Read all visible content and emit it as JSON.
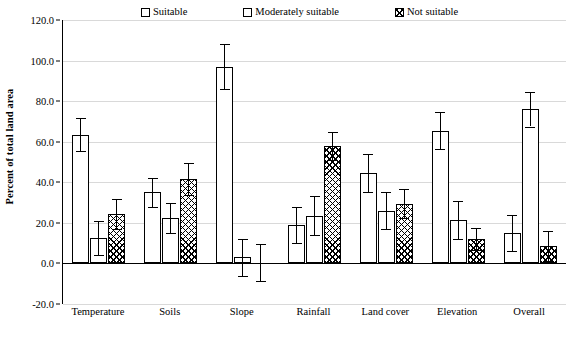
{
  "chart_data": {
    "type": "bar",
    "title": "",
    "subtitle": "",
    "xlabel": "",
    "ylabel": "Percent of total land area",
    "ylim": [
      -20.0,
      120.0
    ],
    "ytick_labels": [
      "120.0",
      "100.0",
      "80.0",
      "60.0",
      "40.0",
      "20.0",
      "0.0",
      "-20.0"
    ],
    "ytick_values": [
      120.0,
      100.0,
      80.0,
      60.0,
      40.0,
      20.0,
      0.0,
      -20.0
    ],
    "grid": true,
    "legend_position": "top-center",
    "categories": [
      "Temperature",
      "Soils",
      "Slope",
      "Rainfall",
      "Land cover",
      "Elevation",
      "Overall"
    ],
    "series": [
      {
        "name": "Suitable",
        "pattern": "dots",
        "values": [
          63.5,
          35.0,
          97.0,
          19.0,
          44.5,
          65.5,
          15.0
        ],
        "errors": [
          8.0,
          7.0,
          11.0,
          9.0,
          9.5,
          9.0,
          9.0
        ]
      },
      {
        "name": "Moderately suitable",
        "pattern": "plain",
        "values": [
          12.5,
          22.5,
          3.0,
          23.5,
          26.0,
          21.5,
          76.0
        ],
        "errors": [
          8.5,
          7.5,
          9.0,
          9.5,
          9.0,
          9.5,
          8.5
        ]
      },
      {
        "name": "Not suitable",
        "pattern": "crosshatch",
        "values": [
          24.5,
          41.5,
          0.0,
          58.0,
          29.5,
          12.0,
          8.5
        ],
        "errors": [
          7.5,
          8.0,
          9.5,
          7.0,
          7.0,
          5.5,
          7.5
        ]
      }
    ]
  },
  "legend": {
    "items": [
      {
        "label": "Suitable",
        "pattern": "dots"
      },
      {
        "label": "Moderately suitable",
        "pattern": "plain"
      },
      {
        "label": "Not suitable",
        "pattern": "crosshatch"
      }
    ]
  },
  "axis": {
    "y_title": "Percent of total land area"
  },
  "colors": {
    "axis": "#000000",
    "gridline": "#d9d9d9",
    "bar_fill": "#ffffff",
    "bar_stroke": "#000000",
    "background": "#ffffff"
  }
}
